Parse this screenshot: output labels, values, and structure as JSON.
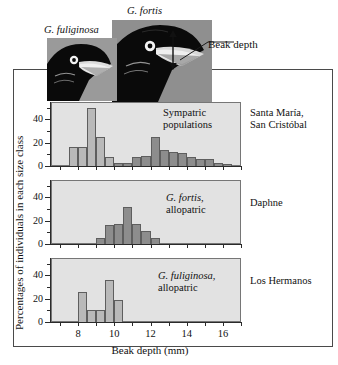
{
  "figure": {
    "photo_labels": {
      "left": "G. fuliginosa",
      "right": "G. fortis"
    },
    "annotation": {
      "beak_depth": "Beak depth"
    }
  },
  "axes": {
    "y_title": "Percentages of individuals in each size class",
    "x_title": "Beak depth (mm)",
    "y_ticks": [
      0,
      20,
      40
    ],
    "y_tick_labels": [
      "0",
      "20",
      "40"
    ],
    "x_ticks": [
      8,
      10,
      12,
      14,
      16
    ],
    "x_tick_labels": [
      "8",
      "10",
      "12",
      "14",
      "16"
    ],
    "x_range": [
      6.5,
      17.0
    ],
    "y_range": [
      0,
      55
    ]
  },
  "panels": [
    {
      "id": "sympatric",
      "note_line1": "Sympatric",
      "note_line2": "populations",
      "note_italic_line": "",
      "location_line1": "Santa María,",
      "location_line2": "San Cristóbal"
    },
    {
      "id": "fortis-allopatric",
      "note_line1": "G. fortis,",
      "note_line2": "allopatric",
      "note_italic_line": "1",
      "location_line1": "Daphne",
      "location_line2": ""
    },
    {
      "id": "fuliginosa-allopatric",
      "note_line1": "G. fuliginosa,",
      "note_line2": "allopatric",
      "note_italic_line": "1",
      "location_line1": "Los Hermanos",
      "location_line2": ""
    }
  ],
  "chart_data": {
    "type": "bar",
    "xlabel": "Beak depth (mm)",
    "ylabel": "Percentages of individuals in each size class",
    "xlim": [
      6.5,
      17.0
    ],
    "ylim": [
      0,
      55
    ],
    "grid": false,
    "legend": "none",
    "bin_width": 0.5,
    "panels": [
      {
        "name": "Sympatric populations",
        "location": "Santa María, San Cristóbal",
        "series": [
          {
            "name": "G. fuliginosa",
            "color": "#b9b9b9",
            "bins": [
              7.5,
              8.0,
              8.5,
              9.0,
              9.5
            ],
            "values": [
              16,
              16,
              50,
              25,
              8
            ]
          },
          {
            "name": "G. fortis",
            "color": "#8d8d8d",
            "bins": [
              10.0,
              10.5,
              11.0,
              11.5,
              12.0,
              12.5,
              13.0,
              13.5,
              14.0,
              14.5,
              15.0,
              15.5,
              16.0
            ],
            "values": [
              3,
              3,
              8,
              9,
              25,
              14,
              12,
              11,
              8,
              6,
              6,
              3,
              2
            ]
          }
        ]
      },
      {
        "name": "G. fortis, allopatric",
        "location": "Daphne",
        "series": [
          {
            "name": "G. fortis",
            "color": "#8d8d8d",
            "bins": [
              9.0,
              9.5,
              10.0,
              10.5,
              11.0,
              11.5,
              12.0
            ],
            "values": [
              5,
              16,
              17,
              32,
              17,
              11,
              5
            ]
          }
        ]
      },
      {
        "name": "G. fuliginosa, allopatric",
        "location": "Los Hermanos",
        "series": [
          {
            "name": "G. fuliginosa",
            "color": "#b9b9b9",
            "bins": [
              8.0,
              8.5,
              9.0,
              9.5,
              10.0,
              10.5
            ],
            "values": [
              26,
              10,
              10,
              36,
              19,
              0
            ]
          }
        ]
      }
    ]
  }
}
